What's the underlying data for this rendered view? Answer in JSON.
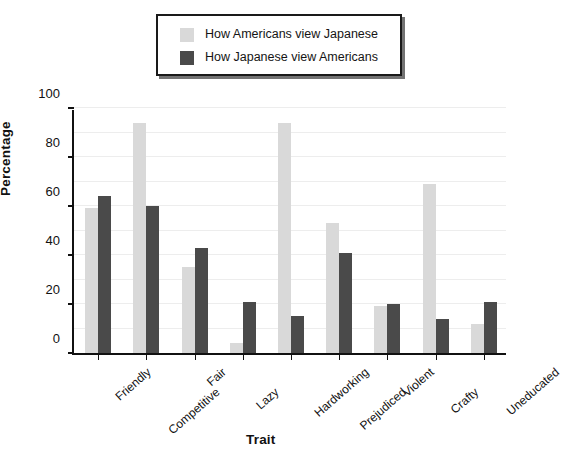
{
  "legend": {
    "entries": [
      {
        "label": "How Americans view Japanese",
        "color": "#d9d9d9",
        "swatch_name": "legend-swatch-americans-view-japanese"
      },
      {
        "label": "How Japanese view Americans",
        "color": "#4a4a4a",
        "swatch_name": "legend-swatch-japanese-view-americans"
      }
    ]
  },
  "axes": {
    "ylabel": "Percentage",
    "xlabel": "Trait",
    "yticks": [
      "0",
      "20",
      "40",
      "60",
      "80",
      "100"
    ]
  },
  "chart_data": {
    "type": "bar",
    "title": "",
    "xlabel": "Trait",
    "ylabel": "Percentage",
    "ylim": [
      0,
      100
    ],
    "yticks": [
      0,
      20,
      40,
      60,
      80,
      100
    ],
    "grid": true,
    "grid_step": 10,
    "legend_position": "top-center",
    "categories": [
      "Friendly",
      "Competitive",
      "Fair",
      "Lazy",
      "Hardworking",
      "Prejudiced",
      "Violent",
      "Crafty",
      "Uneducated"
    ],
    "series": [
      {
        "name": "How Americans view Japanese",
        "color": "#d9d9d9",
        "values": [
          59,
          94,
          35,
          4,
          94,
          53,
          19,
          69,
          12
        ]
      },
      {
        "name": "How Japanese view Americans",
        "color": "#4a4a4a",
        "values": [
          64,
          60,
          43,
          21,
          15,
          41,
          20,
          14,
          21
        ]
      }
    ]
  }
}
